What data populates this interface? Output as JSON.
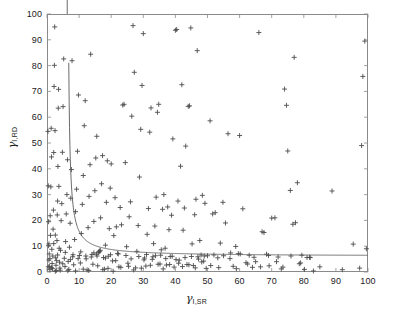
{
  "figure": {
    "background": "#ffffff",
    "axis_color": "#8a8a8a",
    "marker_color": "#4d4d4d",
    "curve_color": "#5a5a5a"
  },
  "axis_labels": {
    "x_symbol": "γ",
    "x_subscript": "I,SR",
    "y_symbol": "γ",
    "y_subscript": "I,RD"
  },
  "ticks": {
    "x": [
      "0",
      "10",
      "20",
      "30",
      "40",
      "50",
      "60",
      "70",
      "80",
      "90",
      "100"
    ],
    "y": [
      "0",
      "10",
      "20",
      "30",
      "40",
      "50",
      "60",
      "70",
      "80",
      "90",
      "100"
    ]
  },
  "chart_data": {
    "type": "scatter",
    "title": "",
    "xlabel": "γ_I,SR",
    "ylabel": "γ_I,RD",
    "xlim": [
      0,
      100
    ],
    "ylim": [
      0,
      100
    ],
    "xticks": [
      0,
      10,
      20,
      30,
      40,
      50,
      60,
      70,
      80,
      90,
      100
    ],
    "yticks": [
      0,
      10,
      20,
      30,
      40,
      50,
      60,
      70,
      80,
      90,
      100
    ],
    "grid": false,
    "legend": null,
    "marker": "plus",
    "marker_size": 5,
    "series": [
      {
        "name": "samples",
        "marker": "+",
        "color": "#4d4d4d",
        "points": [
          [
            0.3,
            54.5
          ],
          [
            0.4,
            33.4
          ],
          [
            0.5,
            19.5
          ],
          [
            0.6,
            10.9
          ],
          [
            0.5,
            10.2
          ],
          [
            0.7,
            7.0
          ],
          [
            0.6,
            4.6
          ],
          [
            0.8,
            2.2
          ],
          [
            0.9,
            0.9
          ],
          [
            1.0,
            21.8
          ],
          [
            1.1,
            14.2
          ],
          [
            1.2,
            33.0
          ],
          [
            1.3,
            55.7
          ],
          [
            1.4,
            44.6
          ],
          [
            1.5,
            8.8
          ],
          [
            1.6,
            3.3
          ],
          [
            1.7,
            1.3
          ],
          [
            1.8,
            6.2
          ],
          [
            1.9,
            16.6
          ],
          [
            2.0,
            24.0
          ],
          [
            2.1,
            46.3
          ],
          [
            2.2,
            71.9
          ],
          [
            2.3,
            80.1
          ],
          [
            2.4,
            95.0
          ],
          [
            2.5,
            54.8
          ],
          [
            2.6,
            14.3
          ],
          [
            2.7,
            5.5
          ],
          [
            2.8,
            2.6
          ],
          [
            2.9,
            0.6
          ],
          [
            3.0,
            4.4
          ],
          [
            3.1,
            12.2
          ],
          [
            3.2,
            22.1
          ],
          [
            3.3,
            27.5
          ],
          [
            3.4,
            40.9
          ],
          [
            3.5,
            63.5
          ],
          [
            3.6,
            70.8
          ],
          [
            3.7,
            33.2
          ],
          [
            3.8,
            9.2
          ],
          [
            3.9,
            3.8
          ],
          [
            4.0,
            1.5
          ],
          [
            4.2,
            8.4
          ],
          [
            4.4,
            19.9
          ],
          [
            4.6,
            26.5
          ],
          [
            4.8,
            46.4
          ],
          [
            5.0,
            64.1
          ],
          [
            5.2,
            82.6
          ],
          [
            5.4,
            5.3
          ],
          [
            5.6,
            2.1
          ],
          [
            5.8,
            11.8
          ],
          [
            6.0,
            22.5
          ],
          [
            6.2,
            30.0
          ],
          [
            6.4,
            43.5
          ],
          [
            6.6,
            4.1
          ],
          [
            6.8,
            1.0
          ],
          [
            7.0,
            9.6
          ],
          [
            7.2,
            18.9
          ],
          [
            7.4,
            28.6
          ],
          [
            7.6,
            39.7
          ],
          [
            7.8,
            81.9
          ],
          [
            8.0,
            5.9
          ],
          [
            8.3,
            2.8
          ],
          [
            8.6,
            12.6
          ],
          [
            8.9,
            23.4
          ],
          [
            9.2,
            32.1
          ],
          [
            9.5,
            46.8
          ],
          [
            9.8,
            68.6
          ],
          [
            10.1,
            6.4
          ],
          [
            10.4,
            3.5
          ],
          [
            10.7,
            14.9
          ],
          [
            11.0,
            26.2
          ],
          [
            11.3,
            37.4
          ],
          [
            11.6,
            56.7
          ],
          [
            11.9,
            66.4
          ],
          [
            12.2,
            5.1
          ],
          [
            12.5,
            0.8
          ],
          [
            12.8,
            17.2
          ],
          [
            13.1,
            29.3
          ],
          [
            13.4,
            41.6
          ],
          [
            13.6,
            84.4
          ],
          [
            14.0,
            6.8
          ],
          [
            14.3,
            3.0
          ],
          [
            14.6,
            19.6
          ],
          [
            14.9,
            31.5
          ],
          [
            15.2,
            44.2
          ],
          [
            15.5,
            52.6
          ],
          [
            15.8,
            2.4
          ],
          [
            16.1,
            7.5
          ],
          [
            16.4,
            8.1
          ],
          [
            16.7,
            21.0
          ],
          [
            17.0,
            34.2
          ],
          [
            17.3,
            45.1
          ],
          [
            17.6,
            5.6
          ],
          [
            17.9,
            1.1
          ],
          [
            18.2,
            10.4
          ],
          [
            18.5,
            27.0
          ],
          [
            18.8,
            43.1
          ],
          [
            19.1,
            6.1
          ],
          [
            19.4,
            16.8
          ],
          [
            19.7,
            32.5
          ],
          [
            20.0,
            41.9
          ],
          [
            20.4,
            4.3
          ],
          [
            20.8,
            14.1
          ],
          [
            21.2,
            28.8
          ],
          [
            21.6,
            17.5
          ],
          [
            22.0,
            7.2
          ],
          [
            22.4,
            2.0
          ],
          [
            22.8,
            25.0
          ],
          [
            23.2,
            18.3
          ],
          [
            23.6,
            64.7
          ],
          [
            24.0,
            65.0
          ],
          [
            24.4,
            42.4
          ],
          [
            24.8,
            9.8
          ],
          [
            25.2,
            3.4
          ],
          [
            25.6,
            21.4
          ],
          [
            26.0,
            27.2
          ],
          [
            26.4,
            60.4
          ],
          [
            26.8,
            95.5
          ],
          [
            27.2,
            77.4
          ],
          [
            27.6,
            1.6
          ],
          [
            28.0,
            8.0
          ],
          [
            28.4,
            18.0
          ],
          [
            28.8,
            36.8
          ],
          [
            29.2,
            55.3
          ],
          [
            29.6,
            72.3
          ],
          [
            30.0,
            92.4
          ],
          [
            30.4,
            5.4
          ],
          [
            30.8,
            2.3
          ],
          [
            31.2,
            14.6
          ],
          [
            31.6,
            24.6
          ],
          [
            32.0,
            54.2
          ],
          [
            32.4,
            63.6
          ],
          [
            32.8,
            4.9
          ],
          [
            33.2,
            11.0
          ],
          [
            33.6,
            17.8
          ],
          [
            34.0,
            29.0
          ],
          [
            34.4,
            61.9
          ],
          [
            34.8,
            65.0
          ],
          [
            35.2,
            3.1
          ],
          [
            35.6,
            8.6
          ],
          [
            36.0,
            24.3
          ],
          [
            36.4,
            30.0
          ],
          [
            36.8,
            9.2
          ],
          [
            37.2,
            2.7
          ],
          [
            37.6,
            25.2
          ],
          [
            38.0,
            16.4
          ],
          [
            38.4,
            6.0
          ],
          [
            38.8,
            22.0
          ],
          [
            39.2,
            51.6
          ],
          [
            39.6,
            1.9
          ],
          [
            40.0,
            93.7
          ],
          [
            40.4,
            94.0
          ],
          [
            40.8,
            27.5
          ],
          [
            41.2,
            4.6
          ],
          [
            41.6,
            41.0
          ],
          [
            42.0,
            72.6
          ],
          [
            42.4,
            16.2
          ],
          [
            42.8,
            24.8
          ],
          [
            43.2,
            48.8
          ],
          [
            43.6,
            2.9
          ],
          [
            44.0,
            64.2
          ],
          [
            44.4,
            64.4
          ],
          [
            44.8,
            94.6
          ],
          [
            45.2,
            10.9
          ],
          [
            45.6,
            2.5
          ],
          [
            46.0,
            22.2
          ],
          [
            46.4,
            28.2
          ],
          [
            46.8,
            85.8
          ],
          [
            47.2,
            5.0
          ],
          [
            47.6,
            12.2
          ],
          [
            48.0,
            6.6
          ],
          [
            48.4,
            29.7
          ],
          [
            48.8,
            4.2
          ],
          [
            49.2,
            26.6
          ],
          [
            49.6,
            1.4
          ],
          [
            50.0,
            6.3
          ],
          [
            50.8,
            58.6
          ],
          [
            51.6,
            22.5
          ],
          [
            52.4,
            23.0
          ],
          [
            53.2,
            5.5
          ],
          [
            54.0,
            11.2
          ],
          [
            54.8,
            27.0
          ],
          [
            55.6,
            19.0
          ],
          [
            56.4,
            53.6
          ],
          [
            57.2,
            7.4
          ],
          [
            58.0,
            2.2
          ],
          [
            58.8,
            9.9
          ],
          [
            59.6,
            7.1
          ],
          [
            60.0,
            52.9
          ],
          [
            61.0,
            24.5
          ],
          [
            62.0,
            3.6
          ],
          [
            63.0,
            6.5
          ],
          [
            64.0,
            1.8
          ],
          [
            65.0,
            4.0
          ],
          [
            66.0,
            92.8
          ],
          [
            67.0,
            15.6
          ],
          [
            67.6,
            15.3
          ],
          [
            68.4,
            6.9
          ],
          [
            69.2,
            2.4
          ],
          [
            70.0,
            20.9
          ],
          [
            71.0,
            21.0
          ],
          [
            72.0,
            5.8
          ],
          [
            73.0,
            1.2
          ],
          [
            74.0,
            70.9
          ],
          [
            74.6,
            64.6
          ],
          [
            75.0,
            46.9
          ],
          [
            75.8,
            31.6
          ],
          [
            76.6,
            18.5
          ],
          [
            77.0,
            83.2
          ],
          [
            77.4,
            19.1
          ],
          [
            78.0,
            34.6
          ],
          [
            78.6,
            3.2
          ],
          [
            79.4,
            6.5
          ],
          [
            80.2,
            1.0
          ],
          [
            81.0,
            5.6
          ],
          [
            81.8,
            5.7
          ],
          [
            83.0,
            0.4
          ],
          [
            85.0,
            2.0
          ],
          [
            88.8,
            31.4
          ],
          [
            92.0,
            0.9
          ],
          [
            95.4,
            10.8
          ],
          [
            97.4,
            1.5
          ],
          [
            98.0,
            49.0
          ],
          [
            98.4,
            75.8
          ],
          [
            99.0,
            89.5
          ],
          [
            99.5,
            9.0
          ],
          [
            0.4,
            2.0
          ],
          [
            0.9,
            5.2
          ],
          [
            1.4,
            1.7
          ],
          [
            2.1,
            11.0
          ],
          [
            2.6,
            0.3
          ],
          [
            3.3,
            6.6
          ],
          [
            4.1,
            0.7
          ],
          [
            4.9,
            3.2
          ],
          [
            5.7,
            7.6
          ],
          [
            6.5,
            0.5
          ],
          [
            7.3,
            4.8
          ],
          [
            8.1,
            6.7
          ],
          [
            8.9,
            0.4
          ],
          [
            9.7,
            5.2
          ],
          [
            10.5,
            7.8
          ],
          [
            11.3,
            1.1
          ],
          [
            12.1,
            6.2
          ],
          [
            13.0,
            0.6
          ],
          [
            13.8,
            5.8
          ],
          [
            14.6,
            7.4
          ],
          [
            15.4,
            6.9
          ],
          [
            15.6,
            6.2
          ],
          [
            16.2,
            7.9
          ],
          [
            16.6,
            8.4
          ],
          [
            17.4,
            0.9
          ],
          [
            18.2,
            5.4
          ],
          [
            19.0,
            1.4
          ],
          [
            19.8,
            6.7
          ],
          [
            20.6,
            0.3
          ],
          [
            21.4,
            4.4
          ],
          [
            22.2,
            7.0
          ],
          [
            23.0,
            1.8
          ],
          [
            24.6,
            6.4
          ],
          [
            25.4,
            2.2
          ],
          [
            26.2,
            5.1
          ],
          [
            27.0,
            0.8
          ],
          [
            28.6,
            6.0
          ],
          [
            29.4,
            1.5
          ],
          [
            30.2,
            4.7
          ],
          [
            31.0,
            6.8
          ],
          [
            32.2,
            2.6
          ],
          [
            33.0,
            5.9
          ],
          [
            33.8,
            6.3
          ],
          [
            34.6,
            3.0
          ],
          [
            35.4,
            6.5
          ],
          [
            36.2,
            1.2
          ],
          [
            37.0,
            5.2
          ],
          [
            38.2,
            2.9
          ],
          [
            39.0,
            6.1
          ],
          [
            40.2,
            4.8
          ],
          [
            41.0,
            3.4
          ],
          [
            42.2,
            2.1
          ],
          [
            43.0,
            5.6
          ],
          [
            44.2,
            2.8
          ],
          [
            45.0,
            6.0
          ],
          [
            46.2,
            1.6
          ],
          [
            47.0,
            5.9
          ],
          [
            48.2,
            3.9
          ],
          [
            49.0,
            6.2
          ],
          [
            51.0,
            2.5
          ],
          [
            52.0,
            6.6
          ],
          [
            53.5,
            1.7
          ],
          [
            55.0,
            6.3
          ],
          [
            57.0,
            5.2
          ],
          [
            59.0,
            1.3
          ],
          [
            60.2,
            7.0
          ],
          [
            62.5,
            3.1
          ],
          [
            64.5,
            5.7
          ],
          [
            66.5,
            2.0
          ],
          [
            69.0,
            6.4
          ],
          [
            71.5,
            4.0
          ],
          [
            73.5,
            1.9
          ],
          [
            76.0,
            6.2
          ],
          [
            79.0,
            3.5
          ],
          [
            82.0,
            5.6
          ]
        ]
      }
    ],
    "curve": {
      "name": "decision-boundary",
      "description": "hyperbolic threshold curve with vertical asymptote near x=6.3 and horizontal asymptote near y=6.1",
      "color": "#5a5a5a",
      "x_asymptote": 6.3,
      "y_asymptote": 6.1,
      "constant": 36.0
    }
  }
}
